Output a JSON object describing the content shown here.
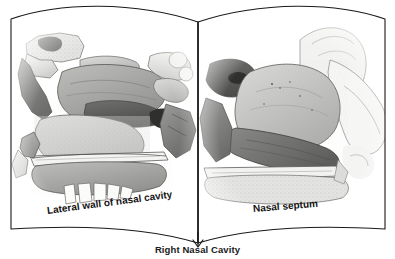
{
  "figure": {
    "kind": "anatomical-illustration",
    "caption": "Right Nasal Cavity",
    "background_color": "#ffffff",
    "outline_color": "#1a1a1a"
  },
  "book": {
    "spine_x": 198,
    "left_page": {
      "label": "Lateral wall of nasal cavity",
      "illustration_name": "lateral-wall-of-nasal-cavity-illustration",
      "description": "Grayscale sagittal section of the lateral nasal wall showing the superior, middle and inferior turbinates, the sphenoid sinus, the hard palate and upper teeth."
    },
    "right_page": {
      "label": "Nasal septum",
      "illustration_name": "nasal-septum-illustration",
      "description": "Grayscale sagittal section of the nasal septum showing the perpendicular plate of the ethmoid, the vomer and the septal cartilage."
    }
  },
  "palette": {
    "ink": "#1a1a1a",
    "bone_light": "#e8e8e6",
    "bone_mid": "#c2c2c0",
    "tissue_mid": "#a8a8a6",
    "tissue_dark": "#7a7a79",
    "shadow_dark": "#585857",
    "tooth_white": "#fbfbfa"
  }
}
